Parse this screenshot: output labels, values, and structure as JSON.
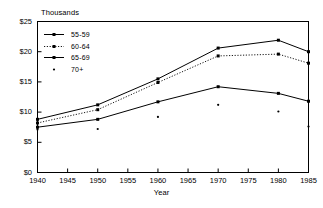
{
  "chart_data": {
    "type": "line",
    "title": "",
    "units_label": "Thousands",
    "xlabel": "Year",
    "ylabel": "",
    "x": [
      1940,
      1950,
      1960,
      1970,
      1980,
      1985
    ],
    "xlim": [
      1940,
      1985
    ],
    "ylim": [
      0,
      25
    ],
    "xticks": [
      "1940",
      "1945",
      "1950",
      "1955",
      "1960",
      "1965",
      "1970",
      "1975",
      "1980",
      "1985"
    ],
    "xtick_values": [
      1940,
      1945,
      1950,
      1955,
      1960,
      1965,
      1970,
      1975,
      1980,
      1985
    ],
    "yticks": [
      "$0",
      "$5",
      "$10",
      "$15",
      "$20",
      "$25"
    ],
    "ytick_values": [
      0,
      5,
      10,
      15,
      20,
      25
    ],
    "grid": false,
    "legend_position": "upper-left",
    "series": [
      {
        "name": "55-59",
        "style": "solid",
        "marker": "square",
        "values": [
          8.8,
          11.2,
          15.5,
          20.6,
          21.9,
          20.0
        ]
      },
      {
        "name": "60-64",
        "style": "dotted",
        "marker": "square",
        "values": [
          8.2,
          10.4,
          14.9,
          19.3,
          19.6,
          18.1
        ]
      },
      {
        "name": "65-69",
        "style": "solid",
        "marker": "square",
        "values": [
          7.5,
          8.8,
          11.7,
          14.2,
          13.1,
          11.8
        ]
      },
      {
        "name": "70+",
        "style": "none",
        "marker": "dot",
        "values": [
          7.1,
          7.2,
          9.2,
          11.2,
          10.1,
          7.6
        ]
      }
    ]
  }
}
